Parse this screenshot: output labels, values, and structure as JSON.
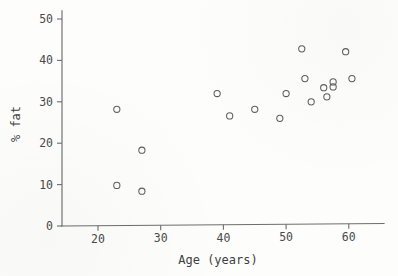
{
  "chart_data": {
    "type": "scatter",
    "title": "",
    "xlabel": "Age (years)",
    "ylabel": "% fat",
    "xlim": [
      14.5,
      65
    ],
    "ylim": [
      0,
      52
    ],
    "xticks": [
      20,
      30,
      40,
      50,
      60
    ],
    "yticks": [
      0,
      10,
      20,
      30,
      40,
      50
    ],
    "xtick_labels": [
      "20",
      "30",
      "40",
      "50",
      "60"
    ],
    "ytick_labels": [
      "0",
      "10",
      "20",
      "30",
      "40",
      "50"
    ],
    "grid": false,
    "legend": null,
    "marker": "open-circle",
    "marker_color": "#5d5d5d",
    "series": [
      {
        "name": "subjects",
        "points": [
          {
            "x": 23,
            "y": 28.2
          },
          {
            "x": 23,
            "y": 9.8
          },
          {
            "x": 27,
            "y": 18.3
          },
          {
            "x": 27,
            "y": 8.4
          },
          {
            "x": 39,
            "y": 32.0
          },
          {
            "x": 41,
            "y": 26.6
          },
          {
            "x": 45,
            "y": 28.2
          },
          {
            "x": 49,
            "y": 26.0
          },
          {
            "x": 50,
            "y": 32.0
          },
          {
            "x": 52.5,
            "y": 42.8
          },
          {
            "x": 53,
            "y": 35.6
          },
          {
            "x": 54,
            "y": 30.0
          },
          {
            "x": 56,
            "y": 33.4
          },
          {
            "x": 56.5,
            "y": 31.2
          },
          {
            "x": 57.5,
            "y": 34.8
          },
          {
            "x": 57.5,
            "y": 33.6
          },
          {
            "x": 59.5,
            "y": 42.1
          },
          {
            "x": 60.5,
            "y": 35.6
          }
        ]
      }
    ],
    "n_points": 18,
    "axis_color": "#6d6d6d"
  },
  "figure": {
    "background": "#fdfdfc"
  }
}
